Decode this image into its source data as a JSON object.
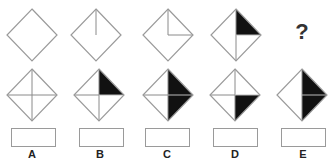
{
  "puzzle": {
    "sequence_label": "Figure sequence",
    "question_mark": "?",
    "stroke_color": "#9a9a9a",
    "inner_line_color": "#8a8a8a",
    "fill_color": "#111111",
    "sequence": [
      {
        "id": "seq-1",
        "cx": 32,
        "cy": 35,
        "lines": [],
        "filled": []
      },
      {
        "id": "seq-2",
        "cx": 96,
        "cy": 35,
        "lines": [
          "top"
        ],
        "filled": []
      },
      {
        "id": "seq-3",
        "cx": 168,
        "cy": 35,
        "lines": [
          "top",
          "right"
        ],
        "filled": []
      },
      {
        "id": "seq-4",
        "cx": 236,
        "cy": 35,
        "lines": [
          "top",
          "bottom",
          "right"
        ],
        "filled": [
          "top-right"
        ]
      }
    ],
    "options": [
      {
        "label": "A",
        "cx": 32,
        "cy": 95,
        "lines": [
          "top",
          "bottom",
          "left",
          "right"
        ],
        "filled": [],
        "box_x": 11
      },
      {
        "label": "B",
        "cx": 99,
        "cy": 95,
        "lines": [
          "top",
          "bottom",
          "left",
          "right"
        ],
        "filled": [
          "top-right"
        ],
        "box_x": 79
      },
      {
        "label": "C",
        "cx": 168,
        "cy": 95,
        "lines": [
          "top",
          "bottom",
          "left",
          "right"
        ],
        "filled": [
          "top-right",
          "bottom-right"
        ],
        "box_x": 145
      },
      {
        "label": "D",
        "cx": 235,
        "cy": 95,
        "lines": [
          "top",
          "bottom",
          "left",
          "right"
        ],
        "filled": [
          "bottom-right"
        ],
        "box_x": 213
      },
      {
        "label": "E",
        "cx": 302,
        "cy": 95,
        "lines": [
          "top",
          "bottom",
          "right"
        ],
        "filled": [
          "top-right",
          "bottom-right"
        ],
        "box_x": 281
      }
    ]
  }
}
